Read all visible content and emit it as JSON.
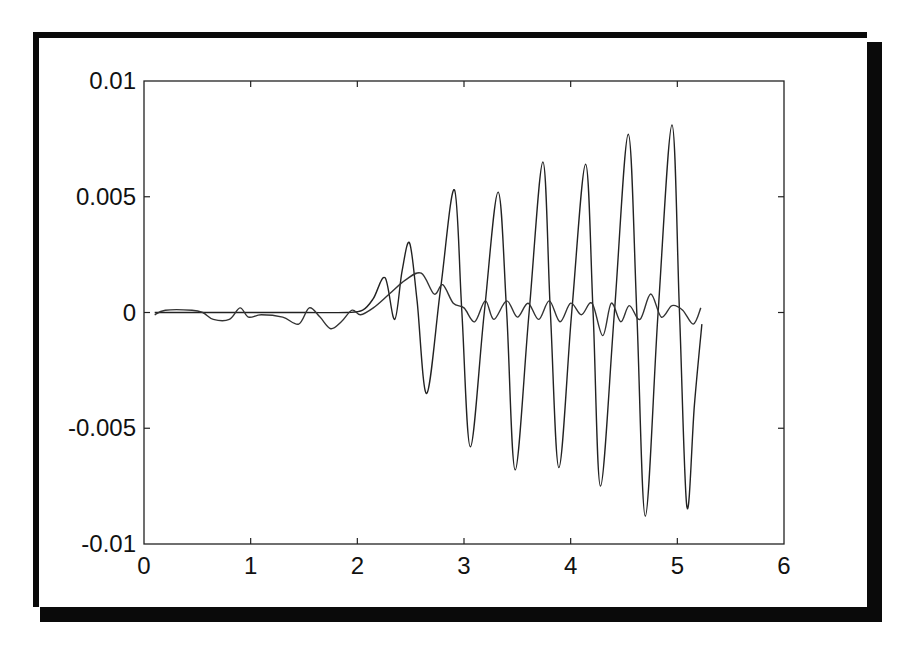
{
  "chart_data": {
    "type": "line",
    "title": "",
    "xlabel": "",
    "ylabel": "",
    "xlim": [
      0,
      6
    ],
    "ylim": [
      -0.01,
      0.01
    ],
    "grid": false,
    "legend": null,
    "x_ticks": [
      "0",
      "1",
      "2",
      "3",
      "4",
      "5",
      "6"
    ],
    "y_ticks": [
      "0.01",
      "0.005",
      "0",
      "-0.005",
      "-0.01"
    ],
    "series": [
      {
        "name": "signal-large",
        "color": "#222222",
        "x": [
          0.1,
          0.5,
          1.0,
          1.5,
          1.9,
          2.05,
          2.15,
          2.26,
          2.35,
          2.42,
          2.49,
          2.56,
          2.65,
          2.78,
          2.91,
          2.98,
          3.06,
          3.19,
          3.32,
          3.4,
          3.48,
          3.61,
          3.74,
          3.81,
          3.89,
          4.01,
          4.14,
          4.21,
          4.28,
          4.41,
          4.54,
          4.62,
          4.7,
          4.82,
          4.95,
          5.02,
          5.09,
          5.16,
          5.23
        ],
        "y": [
          0.0,
          0.0,
          0.0,
          0.0,
          0.0,
          0.0001,
          0.0006,
          0.0015,
          -0.0003,
          0.0018,
          0.003,
          0.0005,
          -0.0035,
          0.001,
          0.0053,
          0.0,
          -0.0058,
          0.0,
          0.0052,
          0.0,
          -0.0068,
          0.0,
          0.0065,
          0.0,
          -0.0067,
          0.0,
          0.0064,
          0.0,
          -0.0075,
          0.0,
          0.0077,
          0.0,
          -0.0088,
          0.0,
          0.0081,
          0.0,
          -0.0084,
          -0.004,
          -0.0005
        ]
      },
      {
        "name": "signal-small",
        "color": "#333333",
        "x": [
          0.1,
          0.2,
          0.45,
          0.55,
          0.65,
          0.8,
          0.9,
          0.98,
          1.1,
          1.3,
          1.45,
          1.55,
          1.65,
          1.75,
          1.85,
          1.95,
          2.03,
          2.15,
          2.3,
          2.45,
          2.6,
          2.72,
          2.8,
          2.9,
          3.0,
          3.1,
          3.2,
          3.28,
          3.4,
          3.5,
          3.6,
          3.7,
          3.8,
          3.9,
          4.0,
          4.1,
          4.2,
          4.3,
          4.38,
          4.47,
          4.55,
          4.65,
          4.75,
          4.85,
          4.95,
          5.05,
          5.15,
          5.22
        ],
        "y": [
          -0.0001,
          0.0001,
          0.0001,
          0.0,
          -0.0003,
          -0.0003,
          0.0002,
          -0.0002,
          -0.0001,
          -0.0002,
          -0.0005,
          0.0002,
          -0.0002,
          -0.0007,
          -0.0004,
          0.0001,
          -0.0001,
          0.0002,
          0.0008,
          0.0014,
          0.0017,
          0.0008,
          0.0012,
          0.0004,
          0.0002,
          -0.0004,
          0.0005,
          -0.0003,
          0.0005,
          -0.0002,
          0.0004,
          -0.0003,
          0.0005,
          -0.0004,
          0.0004,
          -0.0001,
          0.0004,
          -0.001,
          0.0004,
          -0.0004,
          0.0003,
          -0.0003,
          0.0008,
          -0.0002,
          0.0003,
          0.0001,
          -0.0005,
          0.0002
        ]
      }
    ]
  }
}
